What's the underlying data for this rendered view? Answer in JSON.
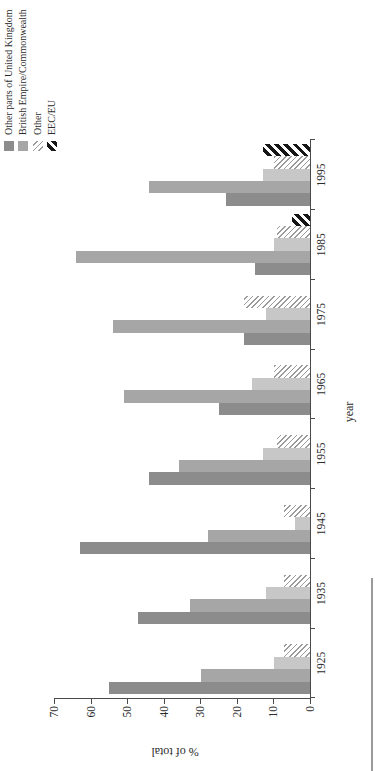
{
  "chart_data": {
    "type": "bar",
    "presentation": "grouped vertical bar chart rendered rotated 90 degrees counter-clockwise (portrait page)",
    "title": "",
    "xlabel": "year",
    "ylabel": "% of total",
    "ylim": [
      0,
      70
    ],
    "yticks": [
      "0",
      "10",
      "20",
      "30",
      "40",
      "50",
      "60",
      "70"
    ],
    "grid": false,
    "legend_position": "top-right of original landscape chart (top-left after rotation)",
    "categories": [
      "1925",
      "1935",
      "1945",
      "1955",
      "1965",
      "1975",
      "1985",
      "1995"
    ],
    "series": [
      {
        "legend_label": "Other parts of United Kingdom",
        "style": "solid",
        "color": "#8c8c8c",
        "values": [
          55,
          47,
          63,
          44,
          25,
          18,
          15,
          23
        ]
      },
      {
        "legend_label": "British Empire/Commonwealth",
        "style": "solid",
        "color": "#a6a6a6",
        "values": [
          30,
          33,
          28,
          36,
          51,
          54,
          64,
          44
        ]
      },
      {
        "legend_label": null,
        "style": "solid",
        "color": "#c7c7c7",
        "values": [
          10,
          12,
          4,
          13,
          16,
          12,
          10,
          13
        ]
      },
      {
        "legend_label": "Other",
        "style": "hatch-thin",
        "color": "#9b9b9b",
        "values": [
          7,
          7,
          7,
          9,
          10,
          18,
          9,
          10
        ]
      },
      {
        "legend_label": "EEC/EU",
        "style": "hatch-bold",
        "color": "#161616",
        "values": [
          null,
          null,
          null,
          null,
          null,
          null,
          5,
          13
        ]
      }
    ],
    "legend": [
      "Other parts of United Kingdom",
      "British Empire/Commonwealth",
      "Other",
      "EEC/EU"
    ]
  }
}
